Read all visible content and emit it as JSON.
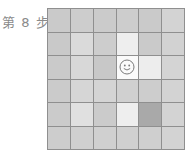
{
  "step_label": "第 8 步",
  "grid": {
    "rows": 6,
    "cols": 6,
    "cells": [
      [
        "#cacaca",
        "#cdcdcd",
        "#cbcbcb",
        "#cdcdcd",
        "#cacaca",
        "#d3d3d3"
      ],
      [
        "#c9c9c9",
        "#dadada",
        "#cdcdcd",
        "#eeeeee",
        "#cacaca",
        "#d2d2d2"
      ],
      [
        "#cacaca",
        "#d8d8d8",
        "#c8c8c8",
        "#fafafa",
        "#ededed",
        "#d4d4d4"
      ],
      [
        "#cbcbcb",
        "#d6d6d6",
        "#d4d4d4",
        "#d0d0d0",
        "#cdcdcd",
        "#d3d3d3"
      ],
      [
        "#cbcbcb",
        "#e0e0e0",
        "#cbcbcb",
        "#eeeeee",
        "#a9a9a9",
        "#d3d3d3"
      ],
      [
        "#cdcdcd",
        "#d0d0d0",
        "#d0d0d0",
        "#d0d0d0",
        "#cfcfcf",
        "#d3d3d3"
      ]
    ],
    "special": {
      "agent": {
        "row": 2,
        "col": 3,
        "icon": "smiley-face-icon"
      },
      "speckled": {
        "row": 4,
        "col": 1
      },
      "dark": {
        "row": 4,
        "col": 4
      }
    }
  }
}
